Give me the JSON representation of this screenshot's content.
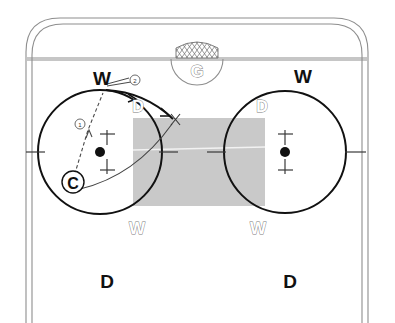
{
  "diagram": {
    "sport": "ice-hockey",
    "background_color": "#ffffff",
    "shade_color": "#c9c9c9",
    "ink_color": "#111111",
    "rink_line_color": "#8e8e8e"
  },
  "labels": {
    "goalie": "G",
    "center": "C",
    "wing_left_top": "W",
    "wing_right_top": "W",
    "wing_left_bottom": "W",
    "wing_right_bottom": "W",
    "defense_left_circle": "D",
    "defense_right_circle": "D",
    "defense_left_bottom": "D",
    "defense_right_bottom": "D",
    "target_x": "X"
  },
  "sequence": [
    {
      "id": "1",
      "marker": "①",
      "from": "C",
      "to": "W",
      "style": "dashed"
    },
    {
      "id": "2",
      "marker": "②",
      "from": "W",
      "to": "X",
      "style": "solid-arrow"
    }
  ],
  "zones": {
    "slot_shaded": "slot-shade-rect",
    "faceoff_circle_left": "left-faceoff-circle",
    "faceoff_circle_right": "right-faceoff-circle",
    "goal_crease": "goal-crease",
    "goal_net": "goal-net"
  }
}
